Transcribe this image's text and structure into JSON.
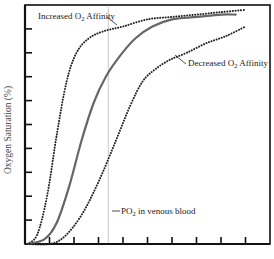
{
  "chart_data": {
    "type": "line",
    "title": "",
    "xlabel": "",
    "ylabel": "Oxygen Saturation (%)",
    "xlim": [
      0,
      10
    ],
    "ylim": [
      0,
      10
    ],
    "x_ticks_count": 9,
    "y_ticks_count": 9,
    "grid": false,
    "legend": "none (inline annotations)",
    "series": [
      {
        "name": "Increased O2 Affinity",
        "style": "dotted",
        "color": "#222222",
        "x": [
          0.1,
          0.5,
          0.9,
          1.3,
          1.7,
          2.1,
          2.6,
          3.2,
          4.0,
          5.0,
          6.0,
          7.0,
          8.0,
          9.0
        ],
        "y": [
          0.0,
          0.4,
          2.0,
          4.6,
          6.8,
          8.0,
          8.6,
          8.9,
          9.1,
          9.4,
          9.5,
          9.6,
          9.7,
          9.8
        ]
      },
      {
        "name": "Normal",
        "style": "solid",
        "color": "#666666",
        "x": [
          0.1,
          0.8,
          1.3,
          1.8,
          2.3,
          2.8,
          3.3,
          3.9,
          4.5,
          5.2,
          6.0,
          7.0,
          8.0,
          8.6
        ],
        "y": [
          0.0,
          0.2,
          0.9,
          2.4,
          4.3,
          5.9,
          7.0,
          7.9,
          8.6,
          9.1,
          9.4,
          9.5,
          9.6,
          9.6
        ]
      },
      {
        "name": "Decreased O2 Affinity",
        "style": "dotted",
        "color": "#222222",
        "x": [
          0.1,
          1.0,
          1.6,
          2.3,
          3.0,
          3.7,
          4.3,
          4.8,
          5.3,
          5.9,
          6.6,
          7.4,
          8.2,
          9.0
        ],
        "y": [
          0.0,
          0.0,
          0.3,
          1.2,
          2.6,
          4.3,
          5.8,
          6.8,
          7.3,
          7.7,
          8.0,
          8.4,
          8.7,
          9.1
        ]
      }
    ],
    "annotations": [
      {
        "text": "Increased O₂ Affinity",
        "target_series": "Increased O2 Affinity"
      },
      {
        "text": "Decreased O₂ Affinity",
        "target_series": "Decreased O2 Affinity"
      },
      {
        "text": "PO₂ in venous blood",
        "type": "vertical_line",
        "x": 3.4
      }
    ]
  },
  "labels": {
    "y_axis": "Oxygen Saturation (%)",
    "increased_prefix": "Increased O",
    "increased_suffix": " Affinity",
    "decreased_prefix": "Decreased O",
    "decreased_suffix": " Affinity",
    "venous_prefix": "PO",
    "venous_suffix": " in venous blood",
    "subscript": "2"
  }
}
